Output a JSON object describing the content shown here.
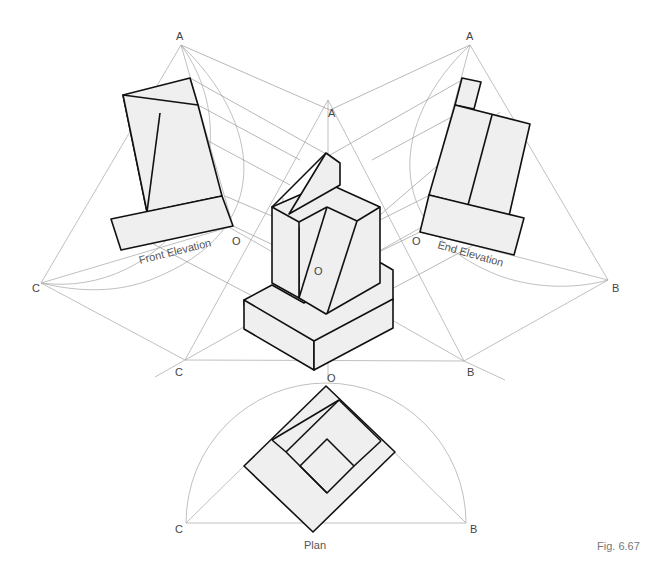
{
  "figure": {
    "caption": "Fig. 6.67",
    "views": {
      "front_elevation": {
        "label": "Front Elevation",
        "points": [
          "A",
          "C",
          "O"
        ]
      },
      "end_elevation": {
        "label": "End Elevation",
        "points": [
          "A",
          "B",
          "O"
        ]
      },
      "isometric": {
        "points": [
          "A",
          "C",
          "B",
          "O"
        ]
      },
      "plan": {
        "label": "Plan",
        "points": [
          "O",
          "C",
          "B"
        ]
      }
    },
    "point_labels": {
      "a_left": "A",
      "a_right": "A",
      "a_center": "A",
      "c_left": "C",
      "c_center": "C",
      "c_plan": "C",
      "b_right": "B",
      "b_center": "B",
      "b_plan": "B",
      "o_front": "O",
      "o_end": "O",
      "o_center": "O",
      "o_plan": "O"
    },
    "colors": {
      "outline": "#111111",
      "fill": "#efefef",
      "construction": "#b0b0b0"
    }
  }
}
